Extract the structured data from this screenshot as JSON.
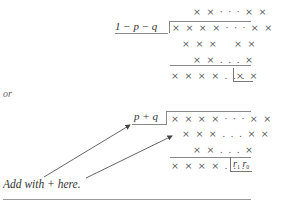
{
  "division1": {
    "quotient": "× × · · · × ×",
    "divisor": "1 − p − q",
    "dividend": "× × × × · · · × ×",
    "row3_left": "× × ×",
    "row3_right": "× ×",
    "row4": "× × . . . ×",
    "result_left": "× × × × . . .",
    "result_boxed": "× ×"
  },
  "separator_word": "or",
  "division2": {
    "divisor": "p + q",
    "dividend": "× × × × · · · × ×",
    "row2": "× × × . . . × ×",
    "row3": "× × . . . ×",
    "result_left": "× × × × . . .",
    "remainder_r1": "r",
    "remainder_r1_sub": "1",
    "remainder_r0": "r",
    "remainder_r0_sub": "0"
  },
  "annotation": {
    "label": "Add with + here."
  }
}
